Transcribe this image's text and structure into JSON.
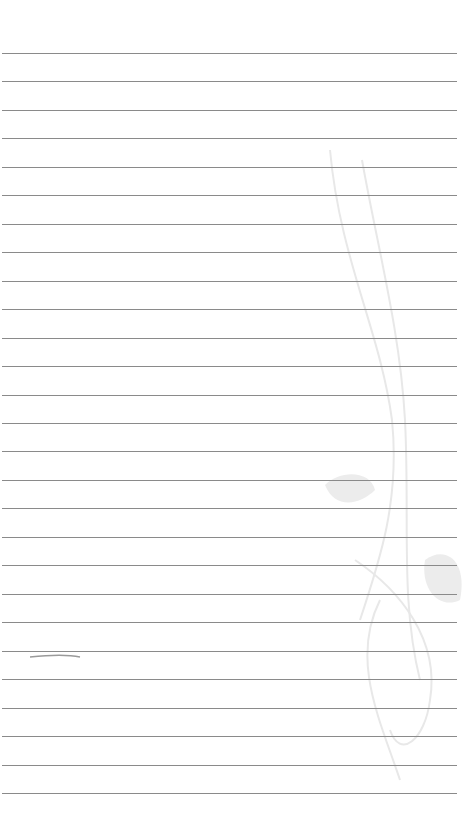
{
  "page": {
    "background_color": "#ffffff",
    "rule_color": "#8a8a8a",
    "decoration_color": "#e6e6e6"
  },
  "rules": {
    "count": 27,
    "first_y": 53,
    "spacing": 28.46,
    "left": 2,
    "width": 455
  },
  "decoration": {
    "icon": "swirl-ornament"
  }
}
